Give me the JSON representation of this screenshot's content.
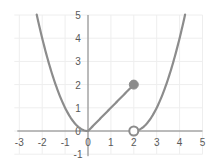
{
  "chart_data": {
    "type": "line",
    "title": "",
    "xlabel": "",
    "ylabel": "",
    "xlim": [
      -3,
      5
    ],
    "ylim": [
      -1,
      5
    ],
    "grid": true,
    "legend": null,
    "x_ticks": [
      "-3",
      "-2",
      "-1",
      "0",
      "1",
      "2",
      "3",
      "4",
      "5"
    ],
    "y_ticks": [
      "-1",
      "0",
      "1",
      "2",
      "3",
      "4",
      "5"
    ],
    "series": [
      {
        "name": "left parabola",
        "formula": "y = x^2",
        "domain": [
          -2.24,
          0
        ],
        "x": [
          -2.24,
          -2,
          -1.5,
          -1,
          -0.5,
          0
        ],
        "y": [
          5,
          4,
          2.25,
          1,
          0.25,
          0
        ]
      },
      {
        "name": "line segment",
        "formula": "y = x",
        "domain": [
          0,
          2
        ],
        "x": [
          0,
          2
        ],
        "y": [
          0,
          2
        ]
      },
      {
        "name": "right parabola",
        "formula": "y = (x-2)^2",
        "domain": [
          2,
          4.24
        ],
        "x": [
          2,
          2.5,
          3,
          3.5,
          4,
          4.24
        ],
        "y": [
          0,
          0.25,
          1,
          2.25,
          4,
          5
        ]
      }
    ],
    "markers": [
      {
        "x": 2,
        "y": 2,
        "style": "closed"
      },
      {
        "x": 2,
        "y": 0,
        "style": "open"
      }
    ],
    "colors": {
      "curve": "#8c8c8c",
      "axis": "#7f7f7f",
      "grid": "#eeeeee",
      "text": "#595959"
    }
  }
}
